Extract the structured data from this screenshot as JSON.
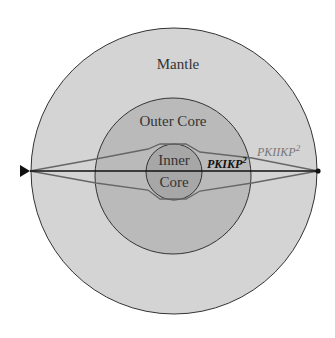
{
  "diagram": {
    "type": "earth-cross-section-ray-paths",
    "layers": [
      {
        "name": "mantle",
        "label": "Mantle",
        "color": "#d3d3d3"
      },
      {
        "name": "outer-core",
        "label": "Outer Core",
        "color": "#b9b9b9"
      },
      {
        "name": "inner-core",
        "label": "Inner",
        "label2": "Core",
        "color": "#a6a6a6"
      }
    ],
    "rays": [
      {
        "name": "PKIKP",
        "label": "PKIKP",
        "sup": "2",
        "color": "#1a1a1a"
      },
      {
        "name": "PKIIKP",
        "label": "PKIIKP",
        "sup": "2",
        "color": "#6e6e6e"
      }
    ],
    "source_marker": "triangle",
    "receiver_marker": "dot"
  }
}
